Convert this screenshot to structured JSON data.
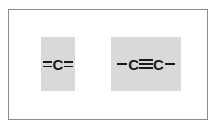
{
  "figure": {
    "background_color": "#ffffff",
    "frame_border_color": "#8c8c8c",
    "panel_fill_color": "#d9d9d9",
    "ink_color": "#1a1a1a",
    "structures": [
      {
        "id": "allene-center",
        "formula_text": "=C=",
        "atom_label": "C",
        "left_bond": "double",
        "right_bond": "double",
        "terminal_left": "",
        "terminal_right": ""
      },
      {
        "id": "alkyne",
        "formula_text": "–C≡C–",
        "atom_label_left": "C",
        "atom_label_right": "C",
        "terminal_left": "single",
        "center_bond": "triple",
        "terminal_right": "single"
      }
    ]
  }
}
